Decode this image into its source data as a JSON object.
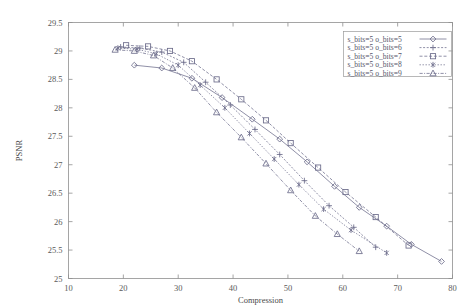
{
  "chart_data": {
    "type": "line",
    "title": "",
    "xlabel": "Compression",
    "ylabel": "PSNR",
    "xlim": [
      10,
      80
    ],
    "ylim": [
      25,
      29.5
    ],
    "xticks": [
      10,
      20,
      30,
      40,
      50,
      60,
      70,
      80
    ],
    "yticks": [
      25,
      25.5,
      26,
      26.5,
      27,
      27.5,
      28,
      28.5,
      29,
      29.5
    ],
    "xtick_labels": [
      "10",
      "20",
      "30",
      "40",
      "50",
      "60",
      "70",
      "80"
    ],
    "ytick_labels": [
      "25",
      "25.5",
      "26",
      "26.5",
      "27",
      "27.5",
      "28",
      "28.5",
      "29",
      "29.5"
    ],
    "grid": false,
    "legend_position": "upper right",
    "series": [
      {
        "name": "s_bits=5 o_bits=5",
        "marker": "diamond",
        "color": "#6b6b8a",
        "x": [
          22.0,
          27.0,
          32.5,
          38.0,
          43.5,
          48.5,
          53.5,
          58.5,
          63.0,
          68.0,
          72.5,
          78.0
        ],
        "y": [
          28.75,
          28.7,
          28.52,
          28.18,
          27.8,
          27.45,
          27.05,
          26.62,
          26.25,
          25.92,
          25.6,
          25.3
        ]
      },
      {
        "name": "s_bits=5 o_bits=6",
        "marker": "plus",
        "color": "#6b6b8a",
        "x": [
          19.5,
          23.0,
          27.0,
          31.0,
          35.0,
          39.5,
          44.0,
          48.5,
          53.0,
          57.5,
          62.0,
          66.0
        ],
        "y": [
          29.07,
          29.05,
          28.98,
          28.8,
          28.45,
          28.05,
          27.62,
          27.18,
          26.72,
          26.28,
          25.9,
          25.55
        ]
      },
      {
        "name": "s_bits=5 o_bits=7",
        "marker": "square",
        "color": "#6b6b8a",
        "x": [
          20.5,
          24.5,
          28.5,
          32.5,
          37.0,
          41.5,
          46.0,
          50.5,
          55.5,
          60.5,
          66.0,
          72.0
        ],
        "y": [
          29.1,
          29.08,
          29.0,
          28.82,
          28.5,
          28.15,
          27.78,
          27.38,
          26.95,
          26.52,
          26.08,
          25.58
        ]
      },
      {
        "name": "s_bits=5 o_bits=8",
        "marker": "star",
        "color": "#6b6b8a",
        "x": [
          19.0,
          22.5,
          26.0,
          30.0,
          34.0,
          38.5,
          43.0,
          47.5,
          52.0,
          56.5,
          61.5,
          68.0
        ],
        "y": [
          29.05,
          29.03,
          28.95,
          28.75,
          28.4,
          28.0,
          27.55,
          27.1,
          26.65,
          26.22,
          25.85,
          25.45
        ]
      },
      {
        "name": "s_bits=5 o_bits=9",
        "marker": "triangle",
        "color": "#6b6b8a",
        "x": [
          18.5,
          22.0,
          25.5,
          29.0,
          33.0,
          37.0,
          41.5,
          46.0,
          50.5,
          55.0,
          59.0,
          63.0
        ],
        "y": [
          29.02,
          29.0,
          28.92,
          28.7,
          28.35,
          27.92,
          27.48,
          27.02,
          26.55,
          26.1,
          25.78,
          25.48
        ]
      }
    ]
  },
  "legend": {
    "entries": [
      "s_bits=5 o_bits=5",
      "s_bits=5 o_bits=6",
      "s_bits=5 o_bits=7",
      "s_bits=5 o_bits=8",
      "s_bits=5 o_bits=9"
    ]
  }
}
